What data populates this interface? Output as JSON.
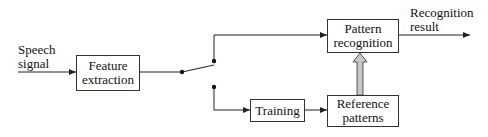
{
  "diagram": {
    "input_label": {
      "line1": "Speech",
      "line2": "signal"
    },
    "output_label": {
      "line1": "Recognition",
      "line2": "result"
    },
    "boxes": {
      "feature_extraction": {
        "line1": "Feature",
        "line2": "extraction"
      },
      "pattern_recognition": {
        "line1": "Pattern",
        "line2": "recognition"
      },
      "training": {
        "line1": "Training"
      },
      "reference_patterns": {
        "line1": "Reference",
        "line2": "patterns"
      }
    },
    "colors": {
      "line": "#222222",
      "box_border": "#333333",
      "hollow_arrow_fill": "#c8c8c8"
    }
  }
}
